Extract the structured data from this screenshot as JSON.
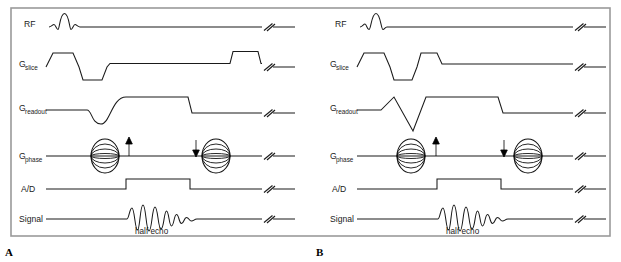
{
  "figure": {
    "type": "mri-pulse-sequence-diagram",
    "border_color": "#9a9a9a",
    "line_color": "#1a1a1a",
    "background": "#ffffff",
    "panels": [
      {
        "letter": "A",
        "channel_labels": [
          {
            "base": "RF",
            "sub": ""
          },
          {
            "base": "G",
            "sub": "slice"
          },
          {
            "base": "G",
            "sub": "readout"
          },
          {
            "base": "G",
            "sub": "phase"
          },
          {
            "base": "A/D",
            "sub": ""
          },
          {
            "base": "Signal",
            "sub": ""
          }
        ],
        "annotations": [
          {
            "name": "half-echo-caption",
            "text": "half echo"
          }
        ],
        "phase_encode_arrows": [
          {
            "name": "phase-encode-up-arrow",
            "direction": "up"
          },
          {
            "name": "phase-encode-down-arrow",
            "direction": "down"
          }
        ],
        "break_symbol_count": 6
      },
      {
        "letter": "B",
        "channel_labels": [
          {
            "base": "RF",
            "sub": ""
          },
          {
            "base": "G",
            "sub": "slice"
          },
          {
            "base": "G",
            "sub": "readout"
          },
          {
            "base": "G",
            "sub": "phase"
          },
          {
            "base": "A/D",
            "sub": ""
          },
          {
            "base": "Signal",
            "sub": ""
          }
        ],
        "annotations": [
          {
            "name": "half-echo-caption",
            "text": "half echo"
          }
        ],
        "phase_encode_arrows": [
          {
            "name": "phase-encode-up-arrow",
            "direction": "up"
          },
          {
            "name": "phase-encode-down-arrow",
            "direction": "down"
          }
        ],
        "break_symbol_count": 6
      }
    ]
  },
  "labels": {
    "rf": "RF",
    "g": "G",
    "slice": "slice",
    "readout": "readout",
    "phase": "phase",
    "ad": "A/D",
    "signal": "Signal",
    "half_echo": "half echo",
    "panel_a": "A",
    "panel_b": "B"
  }
}
